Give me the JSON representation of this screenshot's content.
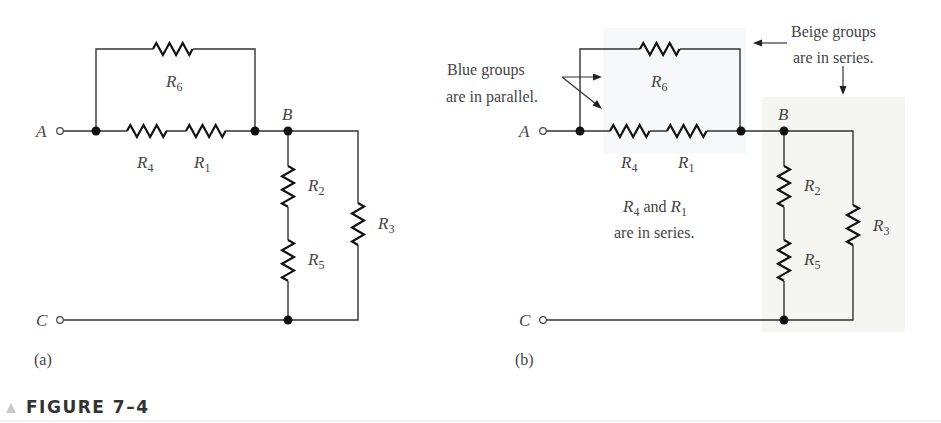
{
  "figure": {
    "caption": "FIGURE 7–4",
    "panels": [
      {
        "id": "a",
        "label": "(a)",
        "terminals": [
          "A",
          "C"
        ],
        "node_label": "B",
        "resistors": [
          "R6",
          "R4",
          "R1",
          "R2",
          "R5",
          "R3"
        ]
      },
      {
        "id": "b",
        "label": "(b)",
        "terminals": [
          "A",
          "C"
        ],
        "node_label": "B",
        "resistors": [
          "R6",
          "R4",
          "R1",
          "R2",
          "R5",
          "R3"
        ],
        "annotations": {
          "blue_line1": "Blue groups",
          "blue_line2": "are in parallel.",
          "beige_line1": "Beige groups",
          "beige_line2": "are in series.",
          "series_line1_a": "R",
          "series_line1_a_sub": "4",
          "series_line1_mid": " and ",
          "series_line1_b": "R",
          "series_line1_b_sub": "1",
          "series_line2": "are in series."
        },
        "highlight_colors": {
          "blue_group": "#f7f8fa",
          "beige_group": "#f6f6f3"
        }
      }
    ]
  },
  "labels": {
    "R": "R",
    "s1": "1",
    "s2": "2",
    "s3": "3",
    "s4": "4",
    "s5": "5",
    "s6": "6"
  }
}
